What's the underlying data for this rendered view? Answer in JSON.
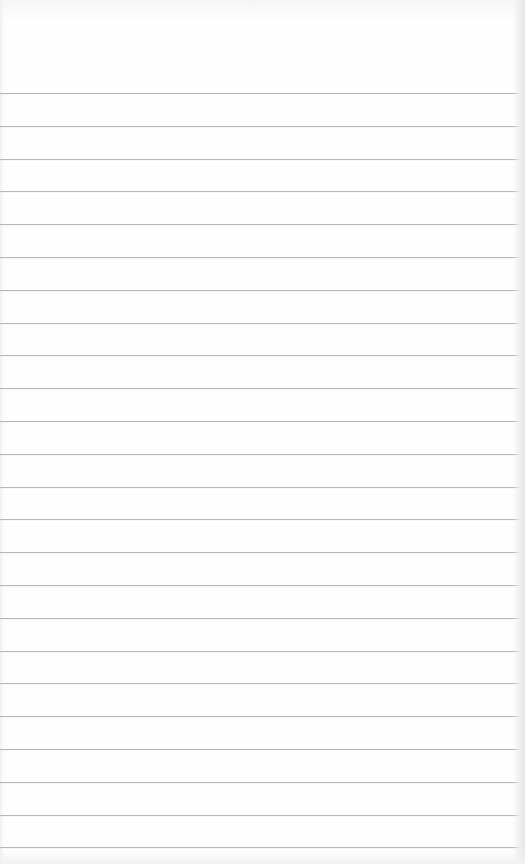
{
  "paper": {
    "type": "lined-notepad",
    "background_color": "#fefefe",
    "line_color": "#b9b9b9",
    "line_count": 24,
    "first_line_y": 93,
    "line_spacing": 32.8,
    "line_width": 520,
    "text_content": []
  }
}
